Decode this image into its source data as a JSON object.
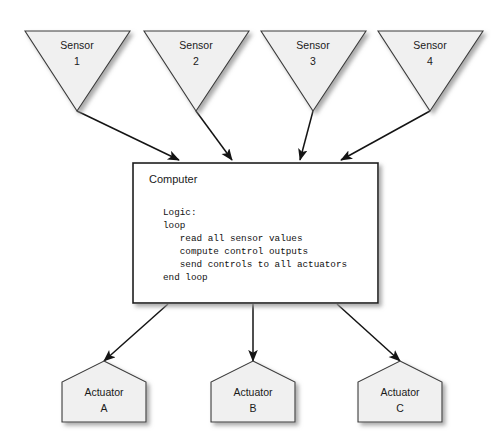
{
  "diagram": {
    "background_color": "#ffffff",
    "shape_fill_color": "#f0f0f0",
    "shape_stroke_color": "#3a3a3a",
    "box_fill_color": "#ffffff",
    "box_stroke_color": "#1c1c1c",
    "connector_color": "#141414"
  },
  "sensors": [
    {
      "name": "Sensor",
      "id": "1"
    },
    {
      "name": "Sensor",
      "id": "2"
    },
    {
      "name": "Sensor",
      "id": "3"
    },
    {
      "name": "Sensor",
      "id": "4"
    }
  ],
  "computer": {
    "title": "Computer",
    "logic": [
      "Logic:",
      "loop",
      "   read all sensor values",
      "   compute control outputs",
      "   send controls to all actuators",
      "end loop"
    ]
  },
  "actuators": [
    {
      "name": "Actuator",
      "id": "A"
    },
    {
      "name": "Actuator",
      "id": "B"
    },
    {
      "name": "Actuator",
      "id": "C"
    }
  ]
}
